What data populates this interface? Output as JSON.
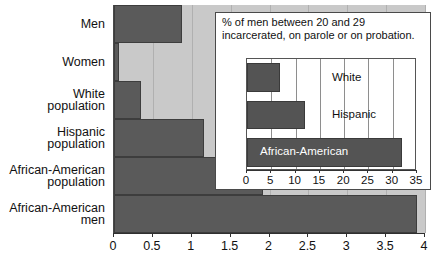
{
  "chart_data": [
    {
      "type": "bar",
      "orientation": "horizontal",
      "id": "main",
      "title": "",
      "xlabel": "",
      "ylabel": "",
      "xlim": [
        0,
        4
      ],
      "xticks": [
        "0",
        "0.5",
        "1",
        "1.5",
        "2",
        "2.5",
        "3",
        "3.5",
        "4"
      ],
      "xtick_values": [
        0,
        0.5,
        1,
        1.5,
        2,
        2.5,
        3,
        3.5,
        4
      ],
      "grid": true,
      "legend": "none",
      "categories": [
        "Men",
        "Women",
        "White\npopulation",
        "Hispanic\npopulation",
        "African-American\npopulation",
        "African-American\nmen"
      ],
      "values": [
        0.87,
        0.07,
        0.35,
        1.16,
        1.92,
        3.9
      ],
      "bar_color": "#5a5a5a",
      "plot_background": "#c9c9c9"
    },
    {
      "type": "bar",
      "orientation": "horizontal",
      "id": "inset",
      "title": "% of men between 20 and 29 incarcerated, on parole or on probation.",
      "xlabel": "",
      "ylabel": "",
      "xlim": [
        0,
        35
      ],
      "xticks": [
        "0",
        "5",
        "10",
        "15",
        "20",
        "25",
        "30",
        "35"
      ],
      "xtick_values": [
        0,
        5,
        10,
        15,
        20,
        25,
        30,
        35
      ],
      "grid": true,
      "legend": "none",
      "categories": [
        "White",
        "Hispanic",
        "African-American"
      ],
      "values": [
        6.7,
        12.0,
        32.0
      ],
      "bar_color": "#545454",
      "plot_background": "#ffffff"
    }
  ],
  "main": {
    "categories": [
      {
        "label": "Men",
        "value": 0.87
      },
      {
        "label": "Women",
        "value": 0.07
      },
      {
        "label": "White\npopulation",
        "value": 0.35
      },
      {
        "label": "Hispanic\npopulation",
        "value": 1.16
      },
      {
        "label": "African-American\npopulation",
        "value": 1.92
      },
      {
        "label": "African-American\nmen",
        "value": 3.9
      }
    ],
    "xticks": [
      "0",
      "0.5",
      "1",
      "1.5",
      "2",
      "2.5",
      "3",
      "3.5",
      "4"
    ]
  },
  "inset": {
    "caption": "% of men between 20 and 29 incarcerated, on parole or on probation.",
    "bars": [
      {
        "label": "White",
        "value": 6.7
      },
      {
        "label": "Hispanic",
        "value": 12.0
      },
      {
        "label": "African-American",
        "value": 32.0
      }
    ],
    "xticks": [
      "0",
      "5",
      "10",
      "15",
      "20",
      "25",
      "30",
      "35"
    ]
  }
}
